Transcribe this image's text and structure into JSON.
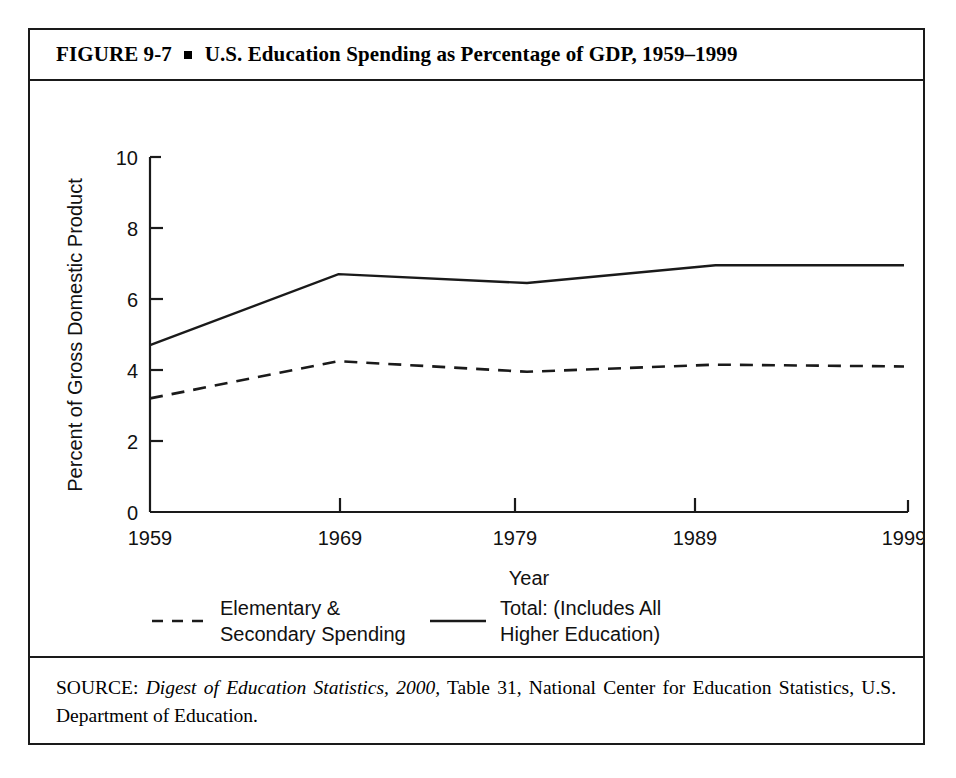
{
  "figure": {
    "title_prefix": "FIGURE  9-7",
    "title_text": "U.S. Education Spending as Percentage of GDP, 1959–1999",
    "bullet_icon": "square-bullet-icon"
  },
  "source": {
    "label": "SOURCE:",
    "italic_part": "Digest of Education Statistics, 2000,",
    "rest": " Table 31, National Center for Education Statistics, U.S. Department of Education."
  },
  "chart_data": {
    "type": "line",
    "title": "U.S. Education Spending as Percentage of GDP, 1959–1999",
    "xlabel": "Year",
    "ylabel": "Percent of Gross Domestic Product",
    "x": [
      1959,
      1969,
      1979,
      1989,
      1999
    ],
    "xticklabels": [
      "1959",
      "1969",
      "1979",
      "1989",
      "1999"
    ],
    "yticks": [
      0,
      2,
      4,
      6,
      8,
      10
    ],
    "yticklabels": [
      "0",
      "2",
      "4",
      "6",
      "8",
      "10"
    ],
    "xlim": [
      1959,
      1999
    ],
    "ylim": [
      0,
      10
    ],
    "grid": false,
    "legend_position": "below-axes",
    "series": [
      {
        "name": "Elementary & Secondary Spending",
        "legend_line1": "Elementary &",
        "legend_line2": "Secondary Spending",
        "style": "dashed",
        "color": "#1a1a1a",
        "values": [
          3.2,
          4.25,
          3.95,
          4.15,
          4.1
        ]
      },
      {
        "name": "Total: (Includes All Higher Education)",
        "legend_line1": "Total: (Includes All",
        "legend_line2": "Higher Education)",
        "style": "solid",
        "color": "#1a1a1a",
        "values": [
          4.7,
          6.7,
          6.45,
          6.95,
          6.95
        ]
      }
    ]
  }
}
